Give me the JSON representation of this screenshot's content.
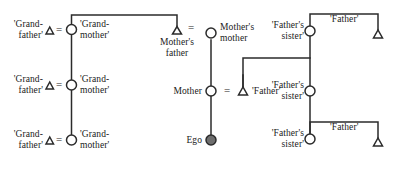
{
  "diagram": {
    "type": "genealogical-kinship-chart",
    "symbols": {
      "male": "triangle",
      "female": "circle",
      "ego": "filled-circle",
      "marriage": "=",
      "descent": "vertical-line",
      "sibling": "horizontal-bracket"
    },
    "colors": {
      "line": "#2b2b2b",
      "text": "#1a1a1a",
      "background": "#ffffff",
      "ego_fill": "#6e6e6e"
    },
    "labels": {
      "grandfather": "'Grand-\nfather'",
      "grandmother": "'Grand-\nmother'",
      "mothers_father": "Mother's\nfather",
      "mothers_mother": "Mother's\nmother",
      "mother": "Mother",
      "father": "'Father'",
      "fathers_sister": "'Father's\nsister'",
      "ego": "Ego",
      "equals": "="
    },
    "nodes": [
      {
        "id": "gf1",
        "label": "'Grand-\nfather'",
        "sex": "male",
        "generation": 1
      },
      {
        "id": "gm1",
        "label": "'Grand-\nmother'",
        "sex": "female",
        "generation": 1
      },
      {
        "id": "gf2",
        "label": "'Grand-\nfather'",
        "sex": "male",
        "generation": 2
      },
      {
        "id": "gm2",
        "label": "'Grand-\nmother'",
        "sex": "female",
        "generation": 2
      },
      {
        "id": "gf3",
        "label": "'Grand-\nfather'",
        "sex": "male",
        "generation": 3
      },
      {
        "id": "gm3",
        "label": "'Grand-\nmother'",
        "sex": "female",
        "generation": 3
      },
      {
        "id": "mf",
        "label": "Mother's\nfather",
        "sex": "male",
        "generation": 1
      },
      {
        "id": "mm",
        "label": "Mother's\nmother",
        "sex": "female",
        "generation": 1
      },
      {
        "id": "mo",
        "label": "Mother",
        "sex": "female",
        "generation": 2
      },
      {
        "id": "fa2",
        "label": "'Father'",
        "sex": "male",
        "generation": 2
      },
      {
        "id": "fs1",
        "label": "'Father's\nsister'",
        "sex": "female",
        "generation": 1
      },
      {
        "id": "fa1",
        "label": "'Father'",
        "sex": "male",
        "generation": 1
      },
      {
        "id": "fs2",
        "label": "'Father's\nsister'",
        "sex": "female",
        "generation": 2
      },
      {
        "id": "fs3",
        "label": "'Father's\nsister'",
        "sex": "female",
        "generation": 3
      },
      {
        "id": "fa3",
        "label": "'Father'",
        "sex": "male",
        "generation": 3
      },
      {
        "id": "ego",
        "label": "Ego",
        "sex": "ego",
        "generation": 3
      }
    ],
    "marriages": [
      {
        "left": "gf1",
        "right": "gm1"
      },
      {
        "left": "gf2",
        "right": "gm2"
      },
      {
        "left": "gf3",
        "right": "gm3"
      },
      {
        "left": "mf",
        "right": "mm"
      },
      {
        "left": "mo",
        "right": "fa2"
      }
    ]
  }
}
